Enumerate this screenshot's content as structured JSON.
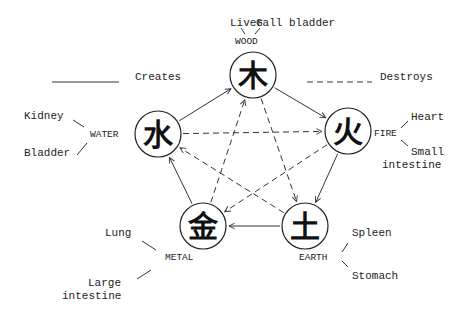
{
  "legend": {
    "creates_label": "Creates",
    "destroys_label": "Destroys"
  },
  "elements": [
    {
      "id": "wood",
      "name": "WOOD",
      "glyph": "木",
      "organs": [
        "Liver",
        "Gall bladder"
      ]
    },
    {
      "id": "fire",
      "name": "FIRE",
      "glyph": "火",
      "organs": [
        "Heart",
        "Small intestine"
      ]
    },
    {
      "id": "earth",
      "name": "EARTH",
      "glyph": "土",
      "organs": [
        "Spleen",
        "Stomach"
      ]
    },
    {
      "id": "metal",
      "name": "METAL",
      "glyph": "金",
      "organs": [
        "Lung",
        "Large intestine"
      ]
    },
    {
      "id": "water",
      "name": "WATER",
      "glyph": "水",
      "organs": [
        "Kidney",
        "Bladder"
      ]
    }
  ],
  "labels": {
    "wood_organ_1": "Liver",
    "wood_organ_2": "Gall bladder",
    "wood_name": "WOOD",
    "fire_organ_1": "Heart",
    "fire_organ_2a": "Small",
    "fire_organ_2b": "intestine",
    "fire_name": "FIRE",
    "earth_organ_1": "Spleen",
    "earth_organ_2": "Stomach",
    "earth_name": "EARTH",
    "metal_organ_1": "Lung",
    "metal_organ_2a": "Large",
    "metal_organ_2b": "intestine",
    "metal_name": "METAL",
    "water_organ_1": "Kidney",
    "water_organ_2": "Bladder",
    "water_name": "WATER",
    "wood_glyph": "木",
    "fire_glyph": "火",
    "earth_glyph": "土",
    "metal_glyph": "金",
    "water_glyph": "水"
  },
  "relations": {
    "creates": [
      [
        "water",
        "wood"
      ],
      [
        "wood",
        "fire"
      ],
      [
        "fire",
        "earth"
      ],
      [
        "earth",
        "metal"
      ],
      [
        "metal",
        "water"
      ]
    ],
    "destroys": [
      [
        "water",
        "fire"
      ],
      [
        "wood",
        "earth"
      ],
      [
        "fire",
        "metal"
      ],
      [
        "earth",
        "water"
      ],
      [
        "metal",
        "wood"
      ]
    ]
  }
}
